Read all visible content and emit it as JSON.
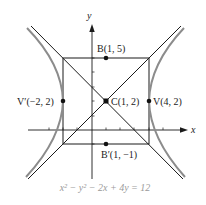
{
  "diagram": {
    "type": "hyperbola-graph",
    "equation": "x² − y² − 2x + 4y = 12",
    "axes": {
      "x_label": "x",
      "y_label": "y"
    },
    "points": [
      {
        "name": "B",
        "label": "B(1, 5)",
        "x": 1,
        "y": 5
      },
      {
        "name": "C",
        "label": "C(1, 2)",
        "x": 1,
        "y": 2
      },
      {
        "name": "V'",
        "label": "V′(−2, 2)",
        "x": -2,
        "y": 2
      },
      {
        "name": "V",
        "label": "V(4, 2)",
        "x": 4,
        "y": 2
      },
      {
        "name": "B'",
        "label": "B′(1, −1)",
        "x": 1,
        "y": -1
      }
    ],
    "fundamental_rectangle": {
      "x_min": -2,
      "x_max": 4,
      "y_min": -1,
      "y_max": 5
    },
    "asymptotes": [
      "y − 2 = x − 1",
      "y − 2 = −(x − 1)"
    ],
    "colors": {
      "curve": "#8c8c8c",
      "lines": "#1a1a1a",
      "equation": "#9a9a9a"
    }
  }
}
